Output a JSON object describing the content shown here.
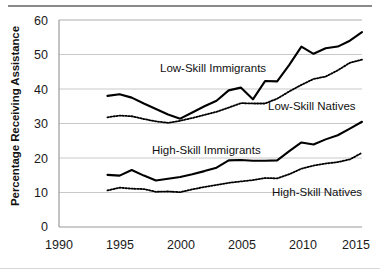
{
  "chart_data": {
    "type": "line",
    "title": "",
    "xlabel": "",
    "ylabel": "Percentage Receiving Assistance",
    "xlim": [
      1990,
      2015
    ],
    "ylim": [
      0,
      60
    ],
    "xticks": [
      "1990",
      "1995",
      "2000",
      "2005",
      "2010",
      "2015"
    ],
    "yticks": [
      "0",
      "10",
      "20",
      "30",
      "40",
      "50",
      "60"
    ],
    "grid": "horizontal",
    "legend_position": "inline-annotations",
    "x": [
      1994,
      1995,
      1996,
      1997,
      1998,
      1999,
      2000,
      2001,
      2002,
      2003,
      2004,
      2005,
      2006,
      2007,
      2008,
      2009,
      2010,
      2011,
      2012,
      2013,
      2014,
      2015
    ],
    "series": [
      {
        "name": "Low-Skill Immigrants",
        "style": "solid",
        "color": "#000000",
        "values": [
          38.0,
          38.5,
          37.5,
          35.8,
          34.2,
          32.6,
          31.4,
          33.2,
          35.0,
          36.6,
          39.6,
          40.4,
          37.0,
          42.3,
          42.2,
          47.0,
          52.3,
          50.2,
          51.8,
          52.3,
          54.0,
          56.5
        ]
      },
      {
        "name": "Low-Skill Natives",
        "style": "dotted",
        "color": "#000000",
        "values": [
          31.8,
          32.3,
          32.1,
          31.3,
          30.6,
          30.2,
          30.8,
          31.6,
          32.5,
          33.4,
          34.6,
          35.9,
          35.8,
          35.8,
          37.2,
          39.3,
          41.2,
          42.9,
          43.6,
          45.4,
          47.6,
          48.5
        ]
      },
      {
        "name": "High-Skill Immigrants",
        "style": "solid",
        "color": "#000000",
        "values": [
          15.1,
          14.9,
          16.5,
          14.9,
          13.5,
          14.0,
          14.5,
          15.3,
          16.2,
          17.2,
          19.3,
          19.4,
          19.2,
          19.2,
          19.3,
          22.0,
          24.5,
          23.9,
          25.4,
          26.6,
          28.5,
          30.5
        ]
      },
      {
        "name": "High-Skill Natives",
        "style": "dotted",
        "color": "#000000",
        "values": [
          10.6,
          11.4,
          11.1,
          11.0,
          10.2,
          10.3,
          10.1,
          10.9,
          11.6,
          12.2,
          12.8,
          13.2,
          13.6,
          14.2,
          14.1,
          15.3,
          16.9,
          17.8,
          18.4,
          18.8,
          19.6,
          21.5
        ]
      }
    ],
    "annotations": [
      {
        "text": "Low-Skill Immigrants",
        "x_px": 160,
        "y_px": 62
      },
      {
        "text": "Low-Skill Natives",
        "x_px": 268,
        "y_px": 100
      },
      {
        "text": "High-Skill Immigrants",
        "x_px": 152,
        "y_px": 144
      },
      {
        "text": "High-Skill Natives",
        "x_px": 272,
        "y_px": 186
      }
    ]
  },
  "axes": {
    "y_title": "Percentage Receiving Assistance",
    "y_tick_values": [
      "60",
      "50",
      "40",
      "30",
      "20",
      "10",
      "0"
    ],
    "x_tick_values": [
      "1990",
      "1995",
      "2000",
      "2005",
      "2010",
      "2015"
    ]
  },
  "colors": {
    "line": "#000000",
    "grid": "#c9c9c9",
    "axis": "#9a9a9a",
    "text": "#111111",
    "top_rule": "#8a8a8a"
  }
}
